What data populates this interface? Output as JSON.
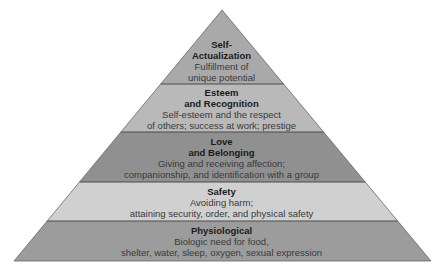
{
  "diagram": {
    "type": "pyramid",
    "colors": {
      "background": "#ffffff",
      "outline": "#555555",
      "divider": "#444444"
    },
    "tiers": [
      {
        "title_line1": "Self-",
        "title_line2": "Actualization",
        "desc_line1": "Fulfillment of",
        "desc_line2": "unique potential",
        "fill": "#a9a9a9"
      },
      {
        "title_line1": "Esteem",
        "title_line2": "and Recognition",
        "desc_line1": "Self-esteem and the respect",
        "desc_line2": "of others; success at work; prestige",
        "fill": "#b9b9b9"
      },
      {
        "title_line1": "Love",
        "title_line2": "and Belonging",
        "desc_line1": "Giving and receiving affection;",
        "desc_line2": "companionship, and identification with a group",
        "fill": "#909090"
      },
      {
        "title_line1": "Safety",
        "desc_line1": "Avoiding harm;",
        "desc_line2": "attaining security, order, and physical safety",
        "fill": "#d0d0d0"
      },
      {
        "title_line1": "Physiological",
        "desc_line1": "Biologic need for food,",
        "desc_line2": "shelter, water, sleep, oxygen, sexual expression",
        "fill": "#9c9c9c"
      }
    ]
  }
}
